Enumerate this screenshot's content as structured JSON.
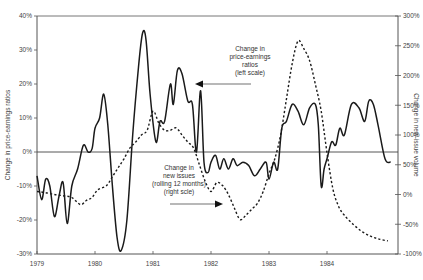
{
  "chart_data": {
    "type": "line",
    "title": "",
    "xlabel": "",
    "ylabel": "Change in price-earnings ratios",
    "ylabel_right": "Change in new-issue volume",
    "x_ticks": [
      "1979",
      "1980",
      "1981",
      "1982",
      "1983",
      "1984"
    ],
    "y_ticks_left": [
      "40%",
      "30%",
      "20%",
      "10%",
      "0%",
      "-10%",
      "-20%",
      "-30%"
    ],
    "y_ticks_right": [
      "300%",
      "250%",
      "200%",
      "150%",
      "100%",
      "50%",
      "0%",
      "-50%",
      "-100%"
    ],
    "ylim_left": [
      -30,
      40
    ],
    "ylim_right": [
      -100,
      300
    ],
    "xlim": [
      1979.0,
      1985.2
    ],
    "grid": false,
    "reference_line": {
      "axis": "left",
      "value": 0
    },
    "annotations": [
      {
        "lines": [
          "Change in",
          "price-earnings",
          "ratios",
          "(left scale)"
        ],
        "arrow": "left",
        "series": "Change in price-earnings ratios (left scale)"
      },
      {
        "lines": [
          "Change in",
          "new issues",
          "(rolling 12 months)",
          "(right scle)"
        ],
        "arrow": "right",
        "series": "Change in new issues (rolling 12 months) (right scale)"
      }
    ],
    "series": [
      {
        "name": "Change in price-earnings ratios (left scale)",
        "axis": "left",
        "style": "solid",
        "x": [
          1979.0,
          1979.08,
          1979.15,
          1979.22,
          1979.3,
          1979.38,
          1979.45,
          1979.52,
          1979.6,
          1979.7,
          1979.8,
          1979.88,
          1979.95,
          1980.0,
          1980.08,
          1980.15,
          1980.22,
          1980.3,
          1980.38,
          1980.45,
          1980.55,
          1980.65,
          1980.75,
          1980.82,
          1980.88,
          1980.95,
          1981.05,
          1981.12,
          1981.2,
          1981.3,
          1981.35,
          1981.42,
          1981.5,
          1981.6,
          1981.68,
          1981.75,
          1981.82,
          1981.88,
          1981.95,
          1982.0,
          1982.08,
          1982.15,
          1982.22,
          1982.3,
          1982.38,
          1982.45,
          1982.55,
          1982.65,
          1982.75,
          1982.85,
          1982.95,
          1983.0,
          1983.08,
          1983.15,
          1983.22,
          1983.3,
          1983.4,
          1983.5,
          1983.6,
          1983.7,
          1983.8,
          1983.85,
          1983.9,
          1983.95,
          1984.0,
          1984.08,
          1984.15,
          1984.22,
          1984.3,
          1984.42,
          1984.55,
          1984.65,
          1984.72,
          1984.8,
          1984.88,
          1985.0,
          1985.1
        ],
        "values": [
          -7,
          -14,
          -8,
          -10,
          -19,
          -13,
          -9,
          -21,
          -10,
          -5,
          2,
          0,
          1,
          7,
          10,
          17,
          8,
          -10,
          -25,
          -29,
          -20,
          5,
          25,
          35,
          33,
          17,
          3,
          9,
          9,
          20,
          14,
          24,
          23,
          15,
          14,
          0,
          18,
          -3,
          -6,
          -3,
          -1,
          -5,
          -2,
          -5,
          -2,
          -4,
          -3,
          -4,
          -7,
          -5,
          -3,
          -8,
          -3,
          -5,
          7,
          9,
          14,
          12,
          8,
          13,
          14,
          8,
          -10,
          -5,
          -2,
          3,
          2,
          7,
          5,
          14,
          13,
          9,
          15,
          14,
          8,
          -2,
          -3
        ]
      },
      {
        "name": "Change in new issues (rolling 12 months) (right scale)",
        "axis": "right",
        "style": "dashed",
        "x": [
          1979.0,
          1979.15,
          1979.3,
          1979.45,
          1979.6,
          1979.75,
          1979.85,
          1979.95,
          1980.05,
          1980.2,
          1980.3,
          1980.4,
          1980.5,
          1980.6,
          1980.7,
          1980.8,
          1980.9,
          1981.0,
          1981.1,
          1981.2,
          1981.3,
          1981.4,
          1981.5,
          1981.6,
          1981.7,
          1981.8,
          1981.9,
          1982.0,
          1982.1,
          1982.2,
          1982.3,
          1982.4,
          1982.5,
          1982.6,
          1982.7,
          1982.8,
          1982.9,
          1983.0,
          1983.1,
          1983.2,
          1983.3,
          1983.4,
          1983.5,
          1983.6,
          1983.7,
          1983.8,
          1983.9,
          1984.0,
          1984.1,
          1984.2,
          1984.3,
          1984.45,
          1984.6,
          1984.75,
          1984.9,
          1985.05
        ],
        "values": [
          5,
          3,
          0,
          -2,
          -5,
          -17,
          -10,
          -5,
          8,
          15,
          30,
          45,
          60,
          78,
          88,
          100,
          108,
          140,
          120,
          108,
          108,
          112,
          100,
          88,
          78,
          50,
          22,
          5,
          20,
          15,
          0,
          -22,
          -42,
          -35,
          -25,
          -15,
          5,
          35,
          60,
          100,
          160,
          220,
          258,
          245,
          225,
          185,
          140,
          70,
          10,
          -20,
          -35,
          -50,
          -62,
          -70,
          -75,
          -78
        ]
      }
    ]
  },
  "axes": {
    "left_label": "Change in price-earnings ratios",
    "right_label": "Change in new-issue volume"
  },
  "annotations": {
    "pe": {
      "l1": "Change in",
      "l2": "price-earnings",
      "l3": "ratios",
      "l4": "(left scale)"
    },
    "ni": {
      "l1": "Change in",
      "l2": "new issues",
      "l3": "(rolling 12 months)",
      "l4": "(right scle)"
    }
  },
  "colors": {
    "line": "#1a1a1a",
    "axis": "#555555",
    "text": "#444444"
  }
}
